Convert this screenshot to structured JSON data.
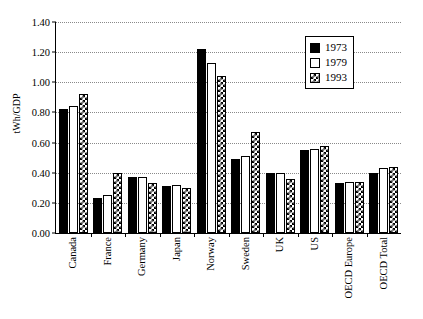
{
  "chart_data": {
    "type": "bar",
    "title": "",
    "xlabel": "",
    "ylabel": "tWh/GDP",
    "ylim": [
      0.0,
      1.4
    ],
    "ytick_labels": [
      "0.00",
      "0.20",
      "0.40",
      "0.60",
      "0.80",
      "1.00",
      "1.20",
      "1.40"
    ],
    "ytick_values": [
      0.0,
      0.2,
      0.4,
      0.6,
      0.8,
      1.0,
      1.2,
      1.4
    ],
    "grid": true,
    "legend_position": "top-right",
    "categories": [
      "Canada",
      "France",
      "Germany",
      "Japan",
      "Norway",
      "Sweden",
      "UK",
      "US",
      "OECD Europe",
      "OECD Total"
    ],
    "series": [
      {
        "name": "1973",
        "fill": "solid-black",
        "color": "#000000",
        "values": [
          0.82,
          0.23,
          0.37,
          0.31,
          1.22,
          0.49,
          0.4,
          0.55,
          0.33,
          0.4
        ]
      },
      {
        "name": "1979",
        "fill": "white",
        "color": "#ffffff",
        "values": [
          0.84,
          0.25,
          0.37,
          0.32,
          1.13,
          0.51,
          0.4,
          0.56,
          0.34,
          0.43
        ]
      },
      {
        "name": "1993",
        "fill": "checkered",
        "color": "#000000",
        "values": [
          0.92,
          0.4,
          0.33,
          0.3,
          1.04,
          0.67,
          0.36,
          0.58,
          0.34,
          0.44
        ]
      }
    ]
  },
  "legend": {
    "items": [
      {
        "label": "1973"
      },
      {
        "label": "1979"
      },
      {
        "label": "1993"
      }
    ]
  }
}
